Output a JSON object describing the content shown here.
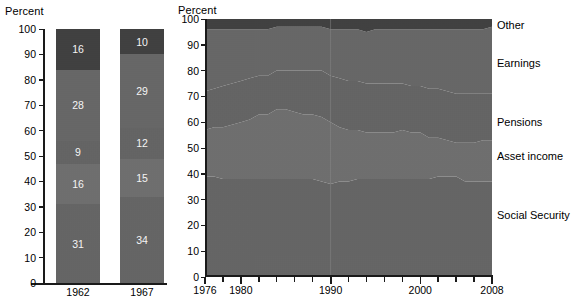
{
  "colors": {
    "social_security": "#646464",
    "asset_income": "#6e6e6e",
    "pensions": "#5c5c5c",
    "earnings": "#666666",
    "other": "#3d3d3d",
    "axis": "#1a1a1a",
    "text": "#000000",
    "value_label": "#ffffff"
  },
  "bar_chart": {
    "axis_title": "Percent",
    "y_ticks": [
      "100",
      "90",
      "80",
      "70",
      "60",
      "50",
      "40",
      "30",
      "20",
      "10",
      "0"
    ],
    "y_values": [
      100,
      90,
      80,
      70,
      60,
      50,
      40,
      30,
      20,
      10,
      0
    ],
    "categories": [
      "1962",
      "1967"
    ],
    "series_order": [
      "Social Security",
      "Asset income",
      "Pensions",
      "Earnings",
      "Other"
    ]
  },
  "area_chart": {
    "axis_title": "Percent",
    "y_ticks": [
      "100",
      "90",
      "80",
      "70",
      "60",
      "50",
      "40",
      "30",
      "20",
      "10",
      "0"
    ],
    "x_ticks": [
      "1976",
      "1980",
      "1990",
      "2000",
      "2008"
    ],
    "x_tick_values": [
      1976,
      1980,
      1990,
      2000,
      2008
    ]
  },
  "legend": [
    {
      "label": "Other",
      "y_pct": 97.5
    },
    {
      "label": "Earnings",
      "y_pct": 83
    },
    {
      "label": "Pensions",
      "y_pct": 60
    },
    {
      "label": "Asset income",
      "y_pct": 47
    },
    {
      "label": "Social Security",
      "y_pct": 24
    }
  ],
  "chart_data": [
    {
      "type": "bar",
      "title": "Percent",
      "subtitle": "",
      "xlabel": "",
      "ylabel": "Percent",
      "ylim": [
        0,
        100
      ],
      "grid": false,
      "stacked": true,
      "categories": [
        "1962",
        "1967"
      ],
      "series": [
        {
          "name": "Social Security",
          "values": [
            31,
            34
          ],
          "color": "#646464"
        },
        {
          "name": "Asset income",
          "values": [
            16,
            15
          ],
          "color": "#6e6e6e"
        },
        {
          "name": "Pensions",
          "values": [
            9,
            12
          ],
          "color": "#636363"
        },
        {
          "name": "Earnings",
          "values": [
            28,
            29
          ],
          "color": "#666666"
        },
        {
          "name": "Other",
          "values": [
            16,
            10
          ],
          "color": "#3d3d3d"
        }
      ],
      "data_labels": [
        {
          "category": "1962",
          "labels": [
            {
              "series": "Other",
              "value": 16
            },
            {
              "series": "Earnings",
              "value": 28
            },
            {
              "series": "Pensions",
              "value": 9
            },
            {
              "series": "Asset income",
              "value": 16
            },
            {
              "series": "Social Security",
              "value": 31
            }
          ]
        },
        {
          "category": "1967",
          "labels": [
            {
              "series": "Other",
              "value": 10
            },
            {
              "series": "Earnings",
              "value": 29
            },
            {
              "series": "Pensions",
              "value": 12
            },
            {
              "series": "Asset income",
              "value": 15
            },
            {
              "series": "Social Security",
              "value": 34
            }
          ]
        }
      ]
    },
    {
      "type": "area",
      "title": "Percent",
      "xlabel": "",
      "ylabel": "Percent",
      "ylim": [
        0,
        100
      ],
      "xlim": [
        1976,
        2008
      ],
      "grid": false,
      "stacked": true,
      "legend_position": "right",
      "x": [
        1976,
        1977,
        1978,
        1979,
        1980,
        1981,
        1982,
        1983,
        1984,
        1985,
        1986,
        1987,
        1988,
        1989,
        1990,
        1991,
        1992,
        1993,
        1994,
        1995,
        1996,
        1997,
        1998,
        1999,
        2000,
        2001,
        2002,
        2003,
        2004,
        2005,
        2006,
        2007,
        2008
      ],
      "series": [
        {
          "name": "Social Security",
          "color": "#646464",
          "values": [
            39,
            39,
            38,
            38,
            38,
            38,
            38,
            38,
            38,
            38,
            38,
            38,
            38,
            37,
            36,
            37,
            37,
            38,
            38,
            38,
            38,
            38,
            38,
            38,
            38,
            38,
            39,
            39,
            39,
            37,
            37,
            37,
            37
          ]
        },
        {
          "name": "Asset income",
          "color": "#6e6e6e",
          "values": [
            18,
            19,
            20,
            21,
            22,
            23,
            25,
            25,
            27,
            27,
            26,
            25,
            25,
            25,
            24,
            21,
            20,
            19,
            18,
            18,
            18,
            18,
            19,
            18,
            18,
            16,
            15,
            14,
            13,
            15,
            15,
            16,
            16
          ]
        },
        {
          "name": "Pensions",
          "color": "#636363",
          "values": [
            15,
            15,
            16,
            16,
            16,
            16,
            15,
            15,
            15,
            15,
            16,
            17,
            17,
            18,
            18,
            19,
            19,
            19,
            19,
            19,
            19,
            19,
            18,
            18,
            18,
            19,
            19,
            19,
            19,
            19,
            19,
            18,
            18
          ]
        },
        {
          "name": "Earnings",
          "color": "#666666",
          "values": [
            24,
            23,
            22,
            21,
            20,
            19,
            18,
            18,
            17,
            17,
            17,
            17,
            17,
            17,
            18,
            19,
            20,
            20,
            20,
            21,
            21,
            21,
            21,
            22,
            22,
            23,
            23,
            24,
            25,
            25,
            25,
            25,
            26
          ]
        },
        {
          "name": "Other",
          "color": "#3d3d3d",
          "values": [
            4,
            4,
            4,
            4,
            4,
            4,
            4,
            4,
            3,
            3,
            3,
            3,
            3,
            3,
            4,
            4,
            4,
            4,
            5,
            4,
            4,
            4,
            4,
            4,
            4,
            4,
            4,
            4,
            4,
            4,
            4,
            4,
            3
          ]
        }
      ]
    }
  ]
}
